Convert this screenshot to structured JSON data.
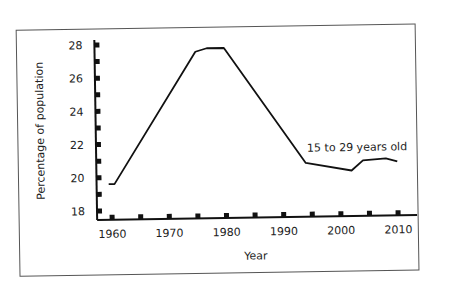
{
  "chart_data": {
    "type": "line",
    "title": "",
    "xlabel": "Year",
    "ylabel": "Percentage of population",
    "xlim": [
      1957,
      2013
    ],
    "ylim": [
      17.5,
      28.3
    ],
    "x_ticks": [
      1960,
      1970,
      1980,
      1990,
      2000,
      2010
    ],
    "x_minor_ticks": [
      1960,
      1965,
      1970,
      1975,
      1980,
      1985,
      1990,
      1995,
      2000,
      2005,
      2010
    ],
    "y_ticks": [
      18,
      20,
      22,
      24,
      26,
      28
    ],
    "y_minor_ticks": [
      18,
      19,
      20,
      21,
      22,
      23,
      24,
      25,
      26,
      27,
      28
    ],
    "grid": false,
    "legend": "none",
    "annotations": [
      {
        "text": "15 to 29 years old",
        "x": 2002,
        "y": 21.7
      }
    ],
    "series": [
      {
        "name": "15 to 29 years old",
        "x": [
          1959.5,
          1960.5,
          1975,
          1977,
          1980,
          1994,
          2002,
          2004,
          2008,
          2010
        ],
        "values": [
          19.6,
          19.6,
          27.5,
          27.7,
          27.7,
          20.7,
          20.2,
          20.8,
          20.9,
          20.7
        ]
      }
    ]
  }
}
